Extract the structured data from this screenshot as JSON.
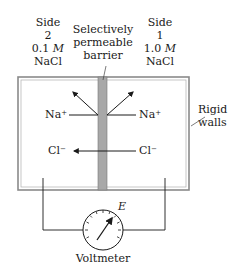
{
  "side2": {
    "line1": "Side",
    "line2": "2",
    "conc_value": "0.1",
    "conc_unit": "M",
    "solute": "NaCl"
  },
  "side1": {
    "line1": "Side",
    "line2": "1",
    "conc_value": "1.0",
    "conc_unit": "M",
    "solute": "NaCl"
  },
  "barrier": {
    "line1": "Selectively",
    "line2": "permeable",
    "line3": "barrier"
  },
  "walls": {
    "line1": "Rigid",
    "line2": "walls"
  },
  "ions": {
    "na_left": {
      "base": "Na",
      "charge": "+"
    },
    "na_right": {
      "base": "Na",
      "charge": "+"
    },
    "cl_left": {
      "base": "Cl",
      "charge": "−"
    },
    "cl_right": {
      "base": "Cl",
      "charge": "−"
    }
  },
  "meter": {
    "label": "Voltmeter",
    "symbol": "E"
  },
  "colors": {
    "barrier_fill": "#a8a8a8",
    "wall": "#888888",
    "line": "#1a1a1a"
  }
}
